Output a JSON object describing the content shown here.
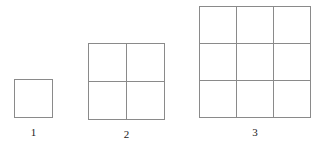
{
  "canvas": {
    "width": 317,
    "height": 149,
    "background_color": "#ffffff",
    "line_color": "#8a8a8a",
    "label_color": "#1a1a1a"
  },
  "figures": [
    {
      "label": "1",
      "rows": 1,
      "columns": 1,
      "cell_count": 1
    },
    {
      "label": "2",
      "rows": 2,
      "columns": 2,
      "cell_count": 4
    },
    {
      "label": "3",
      "rows": 3,
      "columns": 3,
      "cell_count": 9
    }
  ]
}
